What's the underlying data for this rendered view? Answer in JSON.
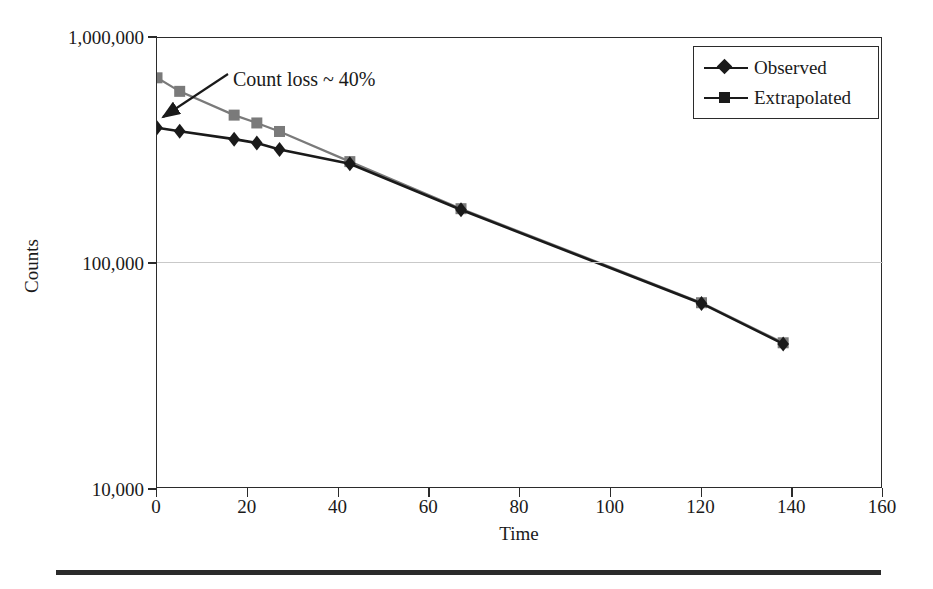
{
  "figure": {
    "y_axis_title": "Counts",
    "x_axis_title": "Time",
    "annotation": "Count loss ~ 40%",
    "legend": {
      "observed_label": "Observed",
      "extrapolated_label": "Extrapolated"
    },
    "colors": {
      "observed": "#1a1a1a",
      "extrapolated": "#7a7a7a",
      "axis": "#2b2b2b",
      "grid": "#c9c9c9",
      "background": "#ffffff"
    }
  },
  "chart_data": {
    "type": "line",
    "title": "",
    "subtitle": "",
    "xlabel": "Time",
    "ylabel": "Counts",
    "xlim": [
      0,
      160
    ],
    "ylim": [
      10000,
      1000000
    ],
    "yscale": "log",
    "xscale": "linear",
    "grid": true,
    "grid_lines_y": [
      100000
    ],
    "legend_position": "top-right",
    "xticks": [
      0,
      20,
      40,
      60,
      80,
      100,
      120,
      140,
      160
    ],
    "xtick_labels": [
      "0",
      "20",
      "40",
      "60",
      "80",
      "100",
      "120",
      "140",
      "160"
    ],
    "yticks": [
      10000,
      100000,
      1000000
    ],
    "ytick_labels": [
      "10,000",
      "100,000",
      "1,000,000"
    ],
    "annotations": [
      {
        "text": "Count loss ~ 40%",
        "points_to_x": 0,
        "points_to_y": 400000,
        "text_x": 17,
        "text_y": 700000
      }
    ],
    "series": [
      {
        "name": "Observed",
        "marker": "diamond",
        "color": "#1a1a1a",
        "x": [
          0,
          5,
          17,
          22,
          27,
          42.5,
          67,
          120,
          138
        ],
        "values": [
          400000,
          386000,
          356000,
          342000,
          320000,
          277000,
          173000,
          66500,
          44000
        ]
      },
      {
        "name": "Extrapolated",
        "marker": "square",
        "color": "#7a7a7a",
        "x": [
          0,
          5,
          17,
          22,
          27,
          42.5,
          67,
          120,
          138
        ],
        "values": [
          666000,
          580000,
          455000,
          420000,
          385000,
          283000,
          175000,
          67000,
          44500
        ]
      }
    ]
  },
  "plot_geometry": {
    "left": 156,
    "top": 37,
    "width": 726,
    "height": 451
  }
}
